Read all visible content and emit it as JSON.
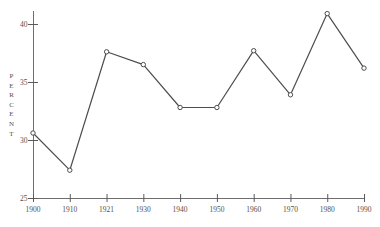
{
  "chart_data": {
    "type": "line",
    "title": "",
    "xlabel": "",
    "ylabel": "PERCENT",
    "categories": [
      "1900",
      "1910",
      "1921",
      "1930",
      "1940",
      "1950",
      "1960",
      "1970",
      "1980",
      "1990"
    ],
    "values": [
      30.6,
      27.4,
      37.6,
      36.5,
      32.8,
      32.8,
      37.7,
      33.9,
      40.9,
      36.2
    ],
    "y_ticks": [
      25,
      30,
      35,
      40
    ],
    "ylim": [
      25,
      41.3
    ],
    "grid": false,
    "legend_position": "none",
    "marker": "open-circle",
    "colors": {
      "line": "#4d4d4d",
      "marker_fill": "#ffffff",
      "axis": "#6e6e6e",
      "tick": "#5a5a5a",
      "text": "#55504c",
      "background": "#ffffff"
    }
  }
}
